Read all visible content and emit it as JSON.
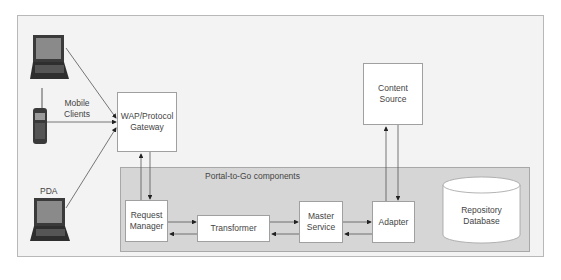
{
  "diagram": {
    "clients": {
      "mobile_clients_label": "Mobile\nClients",
      "pda_label": "PDA",
      "devices": [
        {
          "name": "laptop",
          "icon": "laptop-icon"
        },
        {
          "name": "mobile-phone",
          "icon": "mobile-phone-icon"
        },
        {
          "name": "pda-laptop",
          "icon": "laptop-icon"
        }
      ]
    },
    "gateway": {
      "label": "WAP/Protocol\nGateway"
    },
    "content_source": {
      "label": "Content\nSource"
    },
    "portal": {
      "title": "Portal-to-Go components",
      "components": [
        {
          "id": "request-manager",
          "label": "Request\nManager"
        },
        {
          "id": "transformer",
          "label": "Transformer"
        },
        {
          "id": "master-service",
          "label": "Master\nService"
        },
        {
          "id": "adapter",
          "label": "Adapter"
        }
      ],
      "database": {
        "label": "Repository\nDatabase"
      }
    },
    "colors": {
      "frame_bg": "#f3f3f3",
      "portal_bg": "#d6d6d6",
      "box_bg": "#ffffff",
      "line": "#555555",
      "device": "#3a3a3a"
    }
  }
}
